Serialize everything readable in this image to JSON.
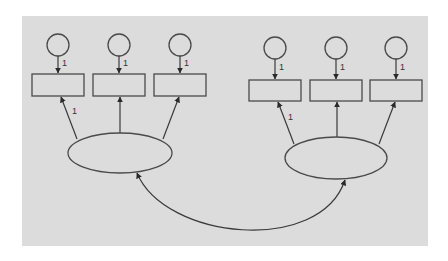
{
  "diagram": {
    "type": "structural-equation-model",
    "background_color": "#dcdcdc",
    "line_color": "#3a3a3a",
    "canvas": {
      "x": 22,
      "y": 16,
      "width": 406,
      "height": 230
    },
    "error_terms": [
      {
        "id": "e1",
        "cx": 58,
        "cy": 45,
        "r": 11,
        "path_label": "1"
      },
      {
        "id": "e2",
        "cx": 119,
        "cy": 45,
        "r": 11,
        "path_label": "1"
      },
      {
        "id": "e3",
        "cx": 180,
        "cy": 45,
        "r": 11,
        "path_label": "1"
      },
      {
        "id": "e4",
        "cx": 275,
        "cy": 48,
        "r": 11,
        "path_label": "1"
      },
      {
        "id": "e5",
        "cx": 336,
        "cy": 48,
        "r": 11,
        "path_label": "1"
      },
      {
        "id": "e6",
        "cx": 396,
        "cy": 48,
        "r": 11,
        "path_label": "1"
      }
    ],
    "observed_variables": [
      {
        "id": "x1",
        "x": 32,
        "y": 74,
        "width": 52,
        "height": 22
      },
      {
        "id": "x2",
        "x": 93,
        "y": 74,
        "width": 52,
        "height": 22
      },
      {
        "id": "x3",
        "x": 154,
        "y": 74,
        "width": 52,
        "height": 22
      },
      {
        "id": "x4",
        "x": 249,
        "y": 80,
        "width": 52,
        "height": 21
      },
      {
        "id": "x5",
        "x": 310,
        "y": 80,
        "width": 52,
        "height": 21
      },
      {
        "id": "x6",
        "x": 370,
        "y": 80,
        "width": 52,
        "height": 21
      }
    ],
    "latent_variables": [
      {
        "id": "F1",
        "cx": 120,
        "cy": 153,
        "rx": 52,
        "ry": 20
      },
      {
        "id": "F2",
        "cx": 336,
        "cy": 158,
        "rx": 51,
        "ry": 21
      }
    ],
    "loadings": [
      {
        "from": "F1",
        "to": "x1",
        "label": "1"
      },
      {
        "from": "F1",
        "to": "x2",
        "label": ""
      },
      {
        "from": "F1",
        "to": "x3",
        "label": ""
      },
      {
        "from": "F2",
        "to": "x4",
        "label": "1"
      },
      {
        "from": "F2",
        "to": "x5",
        "label": ""
      },
      {
        "from": "F2",
        "to": "x6",
        "label": ""
      }
    ],
    "covariances": [
      {
        "between": [
          "F1",
          "F2"
        ],
        "label": ""
      }
    ],
    "labels": {
      "e1_path": "1",
      "e2_path": "1",
      "e3_path": "1",
      "e4_path": "1",
      "e5_path": "1",
      "e6_path": "1",
      "f1_x1_loading": "1",
      "f2_x4_loading": "1"
    }
  }
}
